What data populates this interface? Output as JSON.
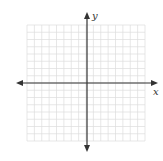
{
  "diagram": {
    "type": "coordinate-plane",
    "grid": {
      "columns": 16,
      "rows": 16,
      "left": 27,
      "top": 25,
      "right": 145,
      "bottom": 141,
      "color": "#dcdcdc"
    },
    "axes": {
      "origin_x": 87,
      "origin_y": 83,
      "x_start": 16,
      "x_end": 158,
      "y_start": 12,
      "y_end": 152,
      "color": "#333333",
      "x_label": "x",
      "y_label": "y"
    }
  }
}
